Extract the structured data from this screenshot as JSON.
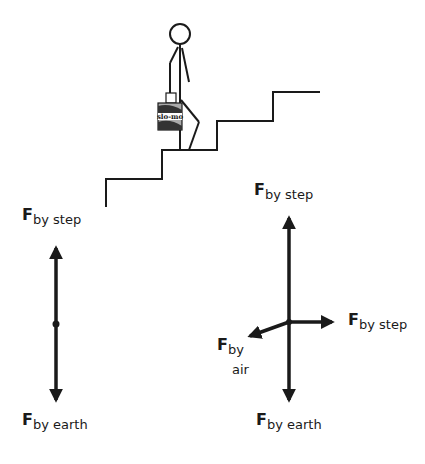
{
  "scene": {
    "briefcase_label": "slo-mo",
    "colors": {
      "ink": "#1a1a1a",
      "background": "#ffffff"
    }
  },
  "left_diagram": {
    "up_force": {
      "symbol": "F",
      "subscript": "by step"
    },
    "down_force": {
      "symbol": "F",
      "subscript": "by earth"
    }
  },
  "right_diagram": {
    "up_force": {
      "symbol": "F",
      "subscript": "by step"
    },
    "right_force": {
      "symbol": "F",
      "subscript": "by step"
    },
    "left_force": {
      "symbol": "F",
      "subscript_line1": "by",
      "subscript_line2": "air"
    },
    "down_force": {
      "symbol": "F",
      "subscript": "by earth"
    }
  }
}
